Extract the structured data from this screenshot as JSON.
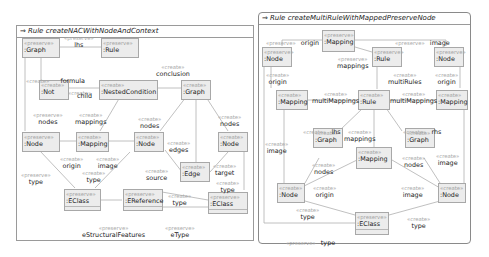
{
  "left_rule": {
    "title": "Rule createNACWithNodeAndContext",
    "nodes": [
      {
        "id": "graph1",
        "stereo": "«preserve»",
        "name": ":Graph"
      },
      {
        "id": "rule1",
        "stereo": "«preserve»",
        "name": ":Rule"
      },
      {
        "id": "not",
        "stereo": "«create»",
        "name": ":Not"
      },
      {
        "id": "nested",
        "stereo": "«create»",
        "name": ":NestedCondition"
      },
      {
        "id": "graph2",
        "stereo": "«create»",
        "name": ":Graph"
      },
      {
        "id": "node1",
        "stereo": "«preserve»",
        "name": ":Node"
      },
      {
        "id": "mapping",
        "stereo": "«create»",
        "name": ":Mapping"
      },
      {
        "id": "node2",
        "stereo": "«create»",
        "name": ":Node"
      },
      {
        "id": "node3",
        "stereo": "«create»",
        "name": ":Node"
      },
      {
        "id": "edge",
        "stereo": "«create»",
        "name": ":Edge"
      },
      {
        "id": "eclass1",
        "stereo": "«preserve»",
        "name": ":EClass"
      },
      {
        "id": "eref",
        "stereo": "«preserve»",
        "name": ":EReference"
      },
      {
        "id": "eclass2",
        "stereo": "«preserve»",
        "name": ":EClass"
      }
    ],
    "labels": [
      {
        "stereo": "«preserve»",
        "name": "lhs"
      },
      {
        "stereo": "«create»",
        "name": "formula"
      },
      {
        "stereo": "«create»",
        "name": "conclusion"
      },
      {
        "stereo": "«create»",
        "name": "child"
      },
      {
        "stereo": "«preserve»",
        "name": "nodes"
      },
      {
        "stereo": "«create»",
        "name": "mappings"
      },
      {
        "stereo": "«create»",
        "name": "nodes"
      },
      {
        "stereo": "«create»",
        "name": "nodes"
      },
      {
        "stereo": "«create»",
        "name": "edges"
      },
      {
        "stereo": "«create»",
        "name": "origin"
      },
      {
        "stereo": "«create»",
        "name": "image"
      },
      {
        "stereo": "«preserve»",
        "name": "type"
      },
      {
        "stereo": "«create»",
        "name": "type"
      },
      {
        "stereo": "«create»",
        "name": "source"
      },
      {
        "stereo": "«create»",
        "name": "target"
      },
      {
        "stereo": "«create»",
        "name": "type"
      },
      {
        "stereo": "«create»",
        "name": "type"
      },
      {
        "stereo": "«preserve»",
        "name": "eStructuralFeatures"
      },
      {
        "stereo": "«preserve»",
        "name": "eType"
      }
    ]
  },
  "right_rule": {
    "title": "Rule createMultiRuleWithMappedPreserveNode",
    "nodes": [
      {
        "id": "mapTop",
        "stereo": "«preserve»",
        "name": ":Mapping"
      },
      {
        "id": "nodeL",
        "stereo": "«preserve»",
        "name": ":Node"
      },
      {
        "id": "ruleTop",
        "stereo": "«preserve»",
        "name": ":Rule"
      },
      {
        "id": "nodeR",
        "stereo": "«preserve»",
        "name": ":Node"
      },
      {
        "id": "mapL",
        "stereo": "«create»",
        "name": ":Mapping"
      },
      {
        "id": "ruleMid",
        "stereo": "«create»",
        "name": ":Rule"
      },
      {
        "id": "mapR",
        "stereo": "«create»",
        "name": ":Mapping"
      },
      {
        "id": "graphL",
        "stereo": "«create»",
        "name": ":Graph"
      },
      {
        "id": "mapMid",
        "stereo": "«create»",
        "name": ":Mapping"
      },
      {
        "id": "graphR",
        "stereo": "«create»",
        "name": ":Graph"
      },
      {
        "id": "nodeBL",
        "stereo": "«create»",
        "name": ":Node"
      },
      {
        "id": "nodeBR",
        "stereo": "«create»",
        "name": ":Node"
      },
      {
        "id": "eclass",
        "stereo": "«preserve»",
        "name": ":EClass"
      }
    ],
    "labels": [
      {
        "stereo": "«preserve»",
        "name": "origin"
      },
      {
        "stereo": "«preserve»",
        "name": "image"
      },
      {
        "stereo": "«preserve»",
        "name": "mappings"
      },
      {
        "stereo": "«create»",
        "name": "origin"
      },
      {
        "stereo": "«create»",
        "name": "multiRules"
      },
      {
        "stereo": "«create»",
        "name": "origin"
      },
      {
        "stereo": "«create»",
        "name": "multiMappings"
      },
      {
        "stereo": "«create»",
        "name": "multiMappings"
      },
      {
        "stereo": "«create»",
        "name": "lhs"
      },
      {
        "stereo": "«create»",
        "name": "rhs"
      },
      {
        "stereo": "«create»",
        "name": "image"
      },
      {
        "stereo": "«create»",
        "name": "mappings"
      },
      {
        "stereo": "«create»",
        "name": "image"
      },
      {
        "stereo": "«create»",
        "name": "nodes"
      },
      {
        "stereo": "«create»",
        "name": "nodes"
      },
      {
        "stereo": "«create»",
        "name": "origin"
      },
      {
        "stereo": "«create»",
        "name": "image"
      },
      {
        "stereo": "«create»",
        "name": "type"
      },
      {
        "stereo": "«create»",
        "name": "type"
      },
      {
        "stereo": "«preserve»",
        "name": "type"
      }
    ]
  },
  "colors": {
    "node_fill": "#ececec",
    "node_border": "#a8a8a8",
    "stereotype_text": "#a3a3a3",
    "edge_line": "#b0b0b0"
  }
}
